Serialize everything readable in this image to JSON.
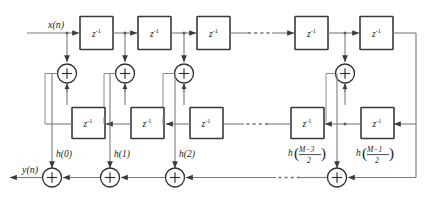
{
  "diagram": {
    "signals": {
      "input_label": "x(n)",
      "output_label": "y(n)"
    },
    "delay_label": {
      "base": "z",
      "exponent": "-1",
      "full": "z⁻¹"
    },
    "adder_symbol": "+",
    "ellipsis_symbol": "· · ·",
    "top_delays": [
      {
        "id": "top-delay-1",
        "label": "z",
        "exponent": "-1"
      },
      {
        "id": "top-delay-2",
        "label": "z",
        "exponent": "-1"
      },
      {
        "id": "top-delay-3",
        "label": "z",
        "exponent": "-1"
      },
      {
        "id": "top-delay-4",
        "label": "z",
        "exponent": "-1"
      },
      {
        "id": "top-delay-5",
        "label": "z",
        "exponent": "-1"
      }
    ],
    "bottom_delays": [
      {
        "id": "bottom-delay-1",
        "label": "z",
        "exponent": "-1"
      },
      {
        "id": "bottom-delay-2",
        "label": "z",
        "exponent": "-1"
      },
      {
        "id": "bottom-delay-3",
        "label": "z",
        "exponent": "-1"
      },
      {
        "id": "bottom-delay-4",
        "label": "z",
        "exponent": "-1"
      },
      {
        "id": "bottom-delay-5",
        "label": "z",
        "exponent": "-1"
      }
    ],
    "upper_adders": [
      {
        "id": "upper-adder-1",
        "symbol": "+"
      },
      {
        "id": "upper-adder-2",
        "symbol": "+"
      },
      {
        "id": "upper-adder-3",
        "symbol": "+"
      },
      {
        "id": "upper-adder-4",
        "symbol": "+"
      }
    ],
    "lower_adders": [
      {
        "id": "lower-adder-1",
        "symbol": "+"
      },
      {
        "id": "lower-adder-2",
        "symbol": "+"
      },
      {
        "id": "lower-adder-3",
        "symbol": "+"
      },
      {
        "id": "lower-adder-4",
        "symbol": "+"
      }
    ],
    "coefficients": [
      {
        "id": "coeff-0",
        "type": "simple",
        "text": "h(0)",
        "fn": "h",
        "arg": "0"
      },
      {
        "id": "coeff-1",
        "type": "simple",
        "text": "h(1)",
        "fn": "h",
        "arg": "1"
      },
      {
        "id": "coeff-2",
        "type": "simple",
        "text": "h(2)",
        "fn": "h",
        "arg": "2"
      },
      {
        "id": "coeff-m3",
        "type": "fraction",
        "fn": "h",
        "numerator": "M−3",
        "denominator": "2"
      },
      {
        "id": "coeff-m1",
        "type": "fraction",
        "fn": "h",
        "numerator": "M−1",
        "denominator": "2"
      }
    ],
    "ellipses": [
      {
        "id": "ellipsis-top-row",
        "style": "dotted-line"
      },
      {
        "id": "ellipsis-middle-row",
        "style": "dotted-line"
      },
      {
        "id": "ellipsis-bottom-row",
        "style": "dotted-arrow"
      }
    ],
    "colors": {
      "wire": "#7b7b7b",
      "block_stroke": "#3a3a3a",
      "text": "#1a1a1a",
      "background": "#ffffff"
    }
  }
}
